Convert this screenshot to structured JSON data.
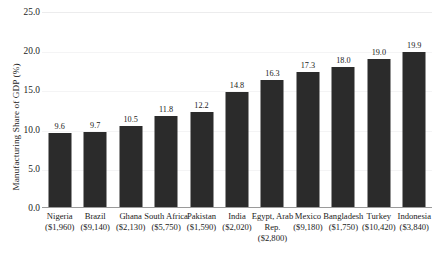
{
  "chart_data": {
    "type": "bar",
    "title": "",
    "xlabel": "",
    "ylabel": "Manufacturing Share of GDP (%)",
    "ylim": [
      0.0,
      25.0
    ],
    "ytick_labels": [
      "25.0",
      "20.0",
      "15.0",
      "10.0",
      "5.0",
      "0.0"
    ],
    "ytick_values": [
      25.0,
      20.0,
      15.0,
      10.0,
      5.0,
      0.0
    ],
    "grid": true,
    "legend": "none",
    "categories": [
      "Nigeria",
      "Brazil",
      "Ghana",
      "South Africa",
      "Pakistan",
      "India",
      "Egypt, Arab Rep.",
      "Mexico",
      "Bangladesh",
      "Turkey",
      "Indonesia"
    ],
    "category_sublabels": [
      "($1,960)",
      "($9,140)",
      "($2,130)",
      "($5,750)",
      "($1,590)",
      "($2,020)",
      "($2,800)",
      "($9,180)",
      "($1,750)",
      "($10,420)",
      "($3,840)"
    ],
    "values": [
      9.6,
      9.7,
      10.5,
      11.8,
      12.2,
      14.8,
      16.3,
      17.3,
      18.0,
      19.0,
      19.9
    ],
    "value_labels": [
      "9.6",
      "9.7",
      "10.5",
      "11.8",
      "12.2",
      "14.8",
      "16.3",
      "17.3",
      "18.0",
      "19.0",
      "19.9"
    ],
    "bar_color": "#2b2b2b",
    "background_color": "#ffffff",
    "axis_color": "#9a9a9a",
    "grid_color": "#f4f4f5"
  }
}
